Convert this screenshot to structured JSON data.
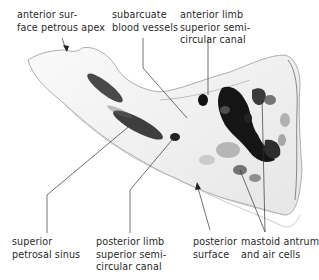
{
  "figure": {
    "labels": {
      "anterior_surface": "anterior sur-\nface petrous apex",
      "subarcuate": "subarcuate\nblood vessels",
      "anterior_limb": "anterior limb\nsuperior semi-\ncircular canal",
      "superior_petrosal": "superior\npetrosal sinus",
      "posterior_limb": "posterior limb\nsuperior semi-\ncircular canal",
      "posterior_surface": "posterior\nsurface",
      "mastoid": "mastoid antrum\nand air cells"
    }
  }
}
